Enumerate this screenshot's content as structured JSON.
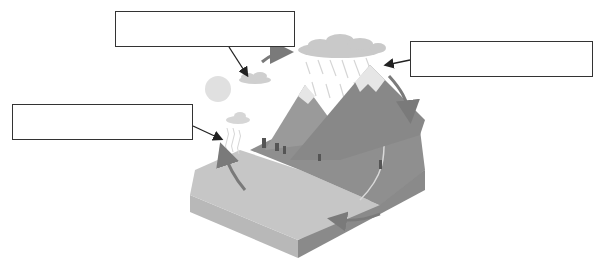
{
  "label_boxes": [
    {
      "id": "box-condensation",
      "text": "",
      "x": 115,
      "y": 11,
      "w": 180,
      "h": 36
    },
    {
      "id": "box-precipitation",
      "text": "",
      "x": 410,
      "y": 41,
      "w": 183,
      "h": 36
    },
    {
      "id": "box-evaporation",
      "text": "",
      "x": 12,
      "y": 104,
      "w": 181,
      "h": 36
    }
  ],
  "colors": {
    "box_border": "#333333",
    "arrow": "#222222",
    "cycle_arrow": "#7a7a7a",
    "mountain": "#8d8d8d",
    "snow": "#e6e6e6",
    "water": "#c4c4c4",
    "ground": "#9a9a9a",
    "cloud": "#cfcfcf",
    "sun": "#e0e0e0"
  }
}
